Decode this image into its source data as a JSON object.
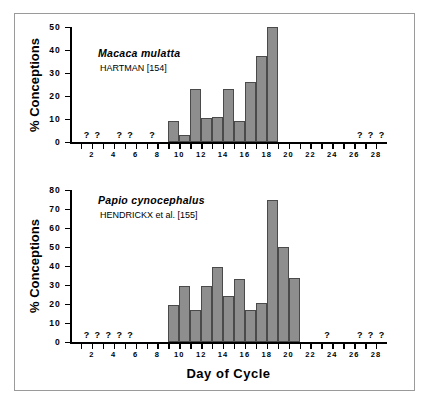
{
  "figure": {
    "x_axis_title": "Day of Cycle",
    "y_axis_title": "% Conceptions"
  },
  "chart_data": [
    {
      "type": "bar",
      "title": "Macaca mulatta",
      "subtitle": "HARTMAN [154]",
      "xlabel": "Day of Cycle",
      "ylabel": "% Conceptions",
      "ylim": [
        0,
        50
      ],
      "ytick_labels": [
        "0",
        "10",
        "20",
        "30",
        "40",
        "50"
      ],
      "ytick_values": [
        0,
        10,
        20,
        30,
        40,
        50
      ],
      "xlim": [
        0,
        29
      ],
      "xtick_labels": [
        "2",
        "4",
        "6",
        "8",
        "10",
        "12",
        "14",
        "16",
        "18",
        "20",
        "22",
        "24",
        "26",
        "28"
      ],
      "xtick_values": [
        2,
        4,
        6,
        8,
        10,
        12,
        14,
        16,
        18,
        20,
        22,
        24,
        26,
        28
      ],
      "grid": false,
      "legend": "none",
      "categories": [
        9,
        10,
        11,
        12,
        13,
        14,
        15,
        16,
        17,
        18
      ],
      "values": [
        9,
        3,
        23,
        10.5,
        11,
        23,
        9,
        26,
        37.5,
        50
      ],
      "no_data_marker": "?",
      "no_data_days": [
        1,
        2,
        4,
        5,
        7,
        26,
        27,
        28
      ]
    },
    {
      "type": "bar",
      "title": "Papio cynocephalus",
      "subtitle": "HENDRICKX et al. [155]",
      "xlabel": "Day of Cycle",
      "ylabel": "% Conceptions",
      "ylim": [
        0,
        80
      ],
      "ytick_labels": [
        "0",
        "10",
        "20",
        "30",
        "40",
        "50",
        "60",
        "70",
        "80"
      ],
      "ytick_values": [
        0,
        10,
        20,
        30,
        40,
        50,
        60,
        70,
        80
      ],
      "xlim": [
        0,
        29
      ],
      "xtick_labels": [
        "2",
        "4",
        "6",
        "8",
        "10",
        "12",
        "14",
        "16",
        "18",
        "20",
        "22",
        "24",
        "26",
        "28"
      ],
      "xtick_values": [
        2,
        4,
        6,
        8,
        10,
        12,
        14,
        16,
        18,
        20,
        22,
        24,
        26,
        28
      ],
      "grid": false,
      "legend": "none",
      "categories": [
        9,
        10,
        11,
        12,
        13,
        14,
        15,
        16,
        17,
        18,
        19,
        20
      ],
      "values": [
        19.5,
        29.5,
        17,
        29.5,
        39.5,
        24,
        33,
        17,
        20.5,
        75,
        50,
        33.5
      ],
      "no_data_marker": "?",
      "no_data_days": [
        1,
        2,
        3,
        4,
        5,
        23,
        26,
        27,
        28
      ]
    }
  ]
}
